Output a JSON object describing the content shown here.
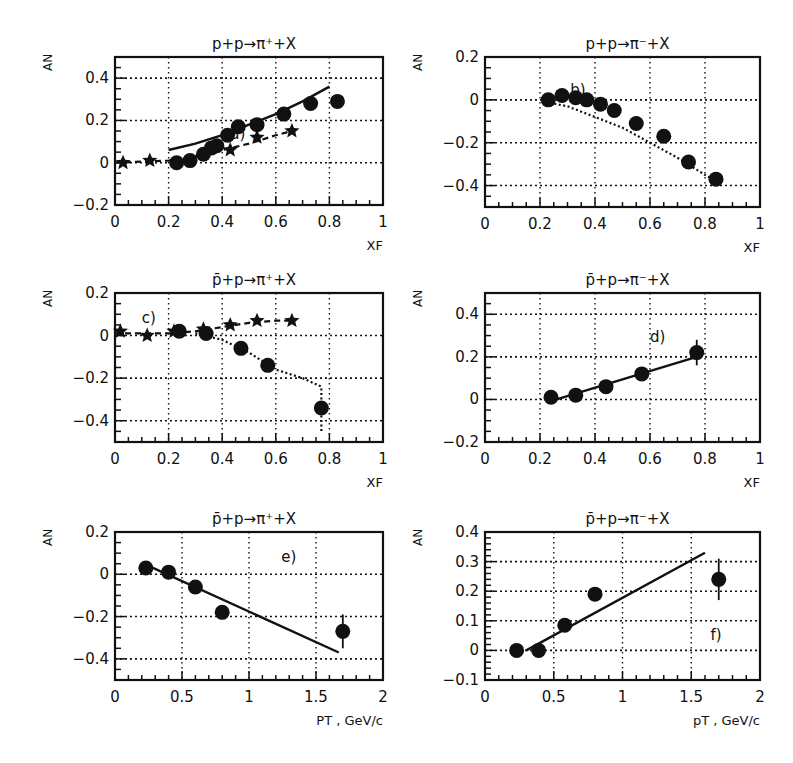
{
  "figure": {
    "background": "#ffffff",
    "ink": "#111111"
  },
  "chart_data": [
    {
      "id": "a",
      "type": "scatter",
      "title": "p+p→π⁺+X",
      "panel_label": "a)",
      "xlabel": "X_F",
      "ylabel": "A_N",
      "xlim": [
        0,
        1
      ],
      "ylim": [
        -0.2,
        0.5
      ],
      "xticks": [
        "0",
        "0.2",
        "0.4",
        "0.6",
        "0.8",
        "1"
      ],
      "yticks": [
        "-0.2",
        "0",
        "0.2",
        "0.4"
      ],
      "grid": true,
      "frame": {
        "left": 115,
        "right": 383,
        "top": 57,
        "bottom": 205
      },
      "series": [
        {
          "name": "circles (data)",
          "marker": "circle",
          "x": [
            0.23,
            0.28,
            0.33,
            0.36,
            0.38,
            0.42,
            0.46,
            0.53,
            0.63,
            0.73,
            0.83
          ],
          "y": [
            0.0,
            0.01,
            0.04,
            0.07,
            0.08,
            0.13,
            0.17,
            0.18,
            0.23,
            0.28,
            0.29
          ]
        },
        {
          "name": "stars (data)",
          "marker": "star",
          "x": [
            0.03,
            0.13,
            0.43,
            0.53,
            0.66
          ],
          "y": [
            0.0,
            0.01,
            0.06,
            0.12,
            0.15
          ]
        },
        {
          "name": "solid curve",
          "line": "solid",
          "x": [
            0.2,
            0.3,
            0.4,
            0.5,
            0.6,
            0.7,
            0.8
          ],
          "y": [
            0.06,
            0.09,
            0.13,
            0.18,
            0.23,
            0.29,
            0.36
          ]
        },
        {
          "name": "dashed curve",
          "line": "dashed",
          "x": [
            0.0,
            0.2,
            0.3,
            0.4,
            0.5,
            0.6,
            0.66
          ],
          "y": [
            0.0,
            0.01,
            0.03,
            0.06,
            0.09,
            0.13,
            0.15
          ]
        }
      ]
    },
    {
      "id": "b",
      "type": "scatter",
      "title": "p+p→π⁻+X",
      "panel_label": "b)",
      "xlabel": "X_F",
      "ylabel": "A_N",
      "xlim": [
        0,
        1
      ],
      "ylim": [
        -0.5,
        0.2
      ],
      "xticks": [
        "0",
        "0.2",
        "0.4",
        "0.6",
        "0.8",
        "1"
      ],
      "yticks": [
        "-0.4",
        "-0.2",
        "0",
        "0.2"
      ],
      "grid": true,
      "frame": {
        "left": 485,
        "right": 760,
        "top": 57,
        "bottom": 207
      },
      "series": [
        {
          "name": "circles (data)",
          "marker": "circle",
          "x": [
            0.23,
            0.28,
            0.33,
            0.37,
            0.42,
            0.47,
            0.55,
            0.65,
            0.74,
            0.84
          ],
          "y": [
            0.0,
            0.02,
            0.01,
            0.0,
            -0.02,
            -0.05,
            -0.11,
            -0.17,
            -0.29,
            -0.37
          ]
        },
        {
          "name": "dotted curve",
          "line": "dotted",
          "x": [
            0.22,
            0.3,
            0.4,
            0.5,
            0.6,
            0.7,
            0.8,
            0.84
          ],
          "y": [
            -0.01,
            -0.03,
            -0.08,
            -0.13,
            -0.2,
            -0.27,
            -0.35,
            -0.38
          ]
        }
      ]
    },
    {
      "id": "c",
      "type": "scatter",
      "title": "p̄+p→π⁺+X",
      "panel_label": "c)",
      "xlabel": "X_F",
      "ylabel": "A_N",
      "xlim": [
        0,
        1
      ],
      "ylim": [
        -0.5,
        0.2
      ],
      "xticks": [
        "0",
        "0.2",
        "0.4",
        "0.6",
        "0.8",
        "1"
      ],
      "yticks": [
        "-0.4",
        "-0.2",
        "0",
        "0.2"
      ],
      "grid": true,
      "frame": {
        "left": 115,
        "right": 383,
        "top": 293,
        "bottom": 442
      },
      "series": [
        {
          "name": "circles (data)",
          "marker": "circle",
          "x": [
            0.24,
            0.34,
            0.47,
            0.57,
            0.77
          ],
          "y": [
            0.02,
            0.01,
            -0.06,
            -0.14,
            -0.34
          ]
        },
        {
          "name": "stars (data)",
          "marker": "star",
          "x": [
            0.02,
            0.12,
            0.22,
            0.33,
            0.43,
            0.53,
            0.66
          ],
          "y": [
            0.02,
            0.0,
            0.02,
            0.03,
            0.05,
            0.07,
            0.07
          ]
        },
        {
          "name": "dashed curve",
          "line": "dashed",
          "x": [
            0.0,
            0.2,
            0.3,
            0.4,
            0.5,
            0.6,
            0.66
          ],
          "y": [
            0.01,
            0.01,
            0.02,
            0.04,
            0.06,
            0.07,
            0.07
          ]
        },
        {
          "name": "dotted curve",
          "line": "dotted",
          "x": [
            0.3,
            0.4,
            0.5,
            0.6,
            0.7,
            0.77,
            0.77
          ],
          "y": [
            0.01,
            -0.02,
            -0.08,
            -0.16,
            -0.2,
            -0.24,
            -0.45
          ]
        }
      ]
    },
    {
      "id": "d",
      "type": "scatter",
      "title": "p̄+p→π⁻+X",
      "panel_label": "d)",
      "xlabel": "X_F",
      "ylabel": "A_N",
      "xlim": [
        0,
        1
      ],
      "ylim": [
        -0.2,
        0.5
      ],
      "xticks": [
        "0",
        "0.2",
        "0.4",
        "0.6",
        "0.8",
        "1"
      ],
      "yticks": [
        "-0.2",
        "0",
        "0.2",
        "0.4"
      ],
      "grid": true,
      "frame": {
        "left": 485,
        "right": 760,
        "top": 293,
        "bottom": 442
      },
      "series": [
        {
          "name": "circles (data)",
          "marker": "circle",
          "x": [
            0.24,
            0.33,
            0.44,
            0.57,
            0.77
          ],
          "y": [
            0.01,
            0.02,
            0.06,
            0.12,
            0.22
          ],
          "yerr": [
            0,
            0,
            0,
            0,
            0.06
          ]
        },
        {
          "name": "linear fit",
          "line": "solid",
          "x": [
            0.26,
            0.77
          ],
          "y": [
            0.0,
            0.2
          ]
        }
      ]
    },
    {
      "id": "e",
      "type": "scatter",
      "title": "p̄+p→π⁺+X",
      "panel_label": "e)",
      "xlabel": "P_T , GeV/c",
      "ylabel": "A_N",
      "xlim": [
        0,
        2
      ],
      "ylim": [
        -0.5,
        0.2
      ],
      "xticks": [
        "0",
        "0.5",
        "1",
        "1.5",
        "2"
      ],
      "yticks": [
        "-0.4",
        "-0.2",
        "0",
        "0.2"
      ],
      "grid": true,
      "frame": {
        "left": 115,
        "right": 383,
        "top": 532,
        "bottom": 680
      },
      "series": [
        {
          "name": "circles (data)",
          "marker": "circle",
          "x": [
            0.23,
            0.4,
            0.6,
            0.8,
            1.7
          ],
          "y": [
            0.03,
            0.01,
            -0.06,
            -0.18,
            -0.27
          ],
          "yerr": [
            0,
            0,
            0,
            0,
            0.08
          ]
        },
        {
          "name": "linear fit",
          "line": "solid",
          "x": [
            0.25,
            1.67
          ],
          "y": [
            0.04,
            -0.37
          ]
        }
      ]
    },
    {
      "id": "f",
      "type": "scatter",
      "title": "p̄+p→π⁻+X",
      "panel_label": "f)",
      "xlabel": "p_T , GeV/c",
      "ylabel": "A_N",
      "xlim": [
        0,
        2
      ],
      "ylim": [
        -0.1,
        0.4
      ],
      "xticks": [
        "0",
        "0.5",
        "1",
        "1.5",
        "2"
      ],
      "yticks": [
        "-0.1",
        "0",
        "0.1",
        "0.2",
        "0.3",
        "0.4"
      ],
      "grid": true,
      "frame": {
        "left": 485,
        "right": 760,
        "top": 532,
        "bottom": 680
      },
      "series": [
        {
          "name": "circles (data)",
          "marker": "circle",
          "x": [
            0.23,
            0.39,
            0.58,
            0.8,
            1.7
          ],
          "y": [
            0.0,
            0.0,
            0.085,
            0.19,
            0.24
          ],
          "yerr": [
            0,
            0,
            0,
            0,
            0.07
          ]
        },
        {
          "name": "linear fit",
          "line": "solid",
          "x": [
            0.3,
            1.6
          ],
          "y": [
            0.0,
            0.33
          ]
        }
      ]
    }
  ]
}
